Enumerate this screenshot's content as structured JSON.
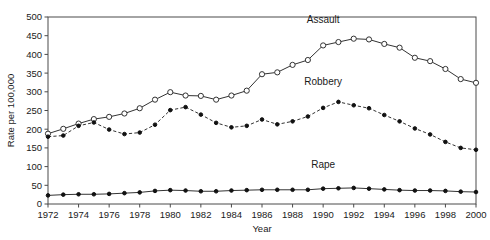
{
  "chart_data": {
    "type": "line",
    "title": "",
    "xlabel": "Year",
    "ylabel": "Rate per 100,000",
    "xlim": [
      1972,
      2000
    ],
    "ylim": [
      0,
      500
    ],
    "grid": false,
    "legend_position": "inline-annotations",
    "xticks": [
      1972,
      1974,
      1976,
      1978,
      1980,
      1982,
      1984,
      1986,
      1988,
      1990,
      1992,
      1994,
      1996,
      1998,
      2000
    ],
    "yticks": [
      0,
      50,
      100,
      150,
      200,
      250,
      300,
      350,
      400,
      450,
      500
    ],
    "x": [
      1972,
      1973,
      1974,
      1975,
      1976,
      1977,
      1978,
      1979,
      1980,
      1981,
      1982,
      1983,
      1984,
      1985,
      1986,
      1987,
      1988,
      1989,
      1990,
      1991,
      1992,
      1993,
      1994,
      1995,
      1996,
      1997,
      1998,
      1999,
      2000
    ],
    "series": [
      {
        "name": "Assault",
        "marker": "open-circle",
        "linestyle": "solid",
        "values": [
          188,
          201,
          215,
          227,
          233,
          242,
          256,
          279,
          299,
          290,
          289,
          279,
          290,
          303,
          347,
          352,
          372,
          385,
          424,
          433,
          442,
          440,
          428,
          418,
          391,
          382,
          361,
          334,
          324
        ]
      },
      {
        "name": "Robbery",
        "marker": "filled-circle",
        "linestyle": "dashed",
        "values": [
          180,
          183,
          209,
          218,
          199,
          187,
          191,
          212,
          251,
          259,
          239,
          217,
          205,
          209,
          226,
          213,
          221,
          234,
          257,
          273,
          264,
          256,
          238,
          221,
          202,
          186,
          166,
          150,
          145
        ]
      },
      {
        "name": "Rape",
        "marker": "filled-circle",
        "linestyle": "solid",
        "values": [
          23,
          25,
          26,
          26,
          27,
          29,
          31,
          35,
          37,
          36,
          34,
          34,
          36,
          37,
          38,
          38,
          38,
          38,
          41,
          42,
          43,
          41,
          39,
          37,
          36,
          36,
          35,
          33,
          32
        ]
      }
    ],
    "annotations": [
      {
        "text": "Assault",
        "x": 1990,
        "y": 485
      },
      {
        "text": "Robbery",
        "x": 1990,
        "y": 318
      },
      {
        "text": "Rape",
        "x": 1990,
        "y": 96
      }
    ]
  },
  "colors": {
    "background": "#ffffff",
    "axis": "#4a4a4a",
    "line": "#333333",
    "text": "#1a1a1a"
  }
}
